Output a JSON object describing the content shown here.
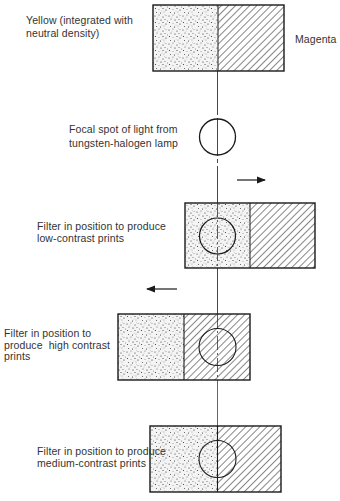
{
  "diagram": {
    "title_labels": {
      "yellow": "Yellow (integrated with\nneutral density)",
      "magenta": "Magenta"
    },
    "focal_spot_label": "Focal spot of light from\ntungsten-halogen lamp",
    "states": [
      {
        "id": "low-contrast",
        "label": "Filter in position to produce\nlow-contrast prints",
        "arrow": "right"
      },
      {
        "id": "high-contrast",
        "label": "Filter in position to\nproduce  high contrast\nprints",
        "arrow": "left"
      },
      {
        "id": "medium-contrast",
        "label": "Filter in position to produce\nmedium-contrast prints",
        "arrow": "none"
      }
    ],
    "legend": {
      "stipple_pattern": "yellow-neutral-density",
      "hatch_pattern": "magenta"
    },
    "colors": {
      "line": "#1a1a1a",
      "background": "#ffffff"
    }
  }
}
